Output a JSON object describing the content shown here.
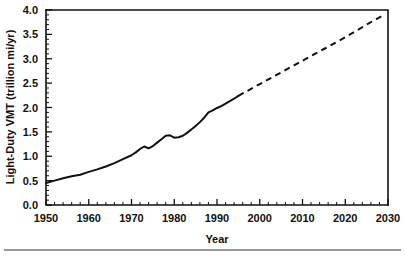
{
  "chart_data": {
    "type": "line",
    "title": "",
    "xlabel": "Year",
    "ylabel": "Light-Duty VMT (trillion mi/yr)",
    "xlim": [
      1950,
      2030
    ],
    "ylim": [
      0.0,
      4.0
    ],
    "grid": false,
    "legend": "none",
    "x_ticks": [
      1950,
      1960,
      1970,
      1980,
      1990,
      2000,
      2010,
      2020,
      2030
    ],
    "x_tick_labels": [
      "1950",
      "1960",
      "1970",
      "1980",
      "1990",
      "2000",
      "2010",
      "2020",
      "2030"
    ],
    "x_minor_tick_interval": 2,
    "y_ticks": [
      0.0,
      0.5,
      1.0,
      1.5,
      2.0,
      2.5,
      3.0,
      3.5,
      4.0
    ],
    "y_tick_labels": [
      "0.0",
      "0.5",
      "1.0",
      "1.5",
      "2.0",
      "2.5",
      "3.0",
      "3.5",
      "4.0"
    ],
    "y_minor_tick_interval": 0.1,
    "axis_color": "#111111",
    "line_color": "#111111",
    "series": [
      {
        "name": "Light-Duty VMT historical",
        "style": "solid",
        "x": [
          1950,
          1952,
          1954,
          1956,
          1958,
          1960,
          1962,
          1964,
          1966,
          1968,
          1970,
          1971,
          1972,
          1973,
          1974,
          1975,
          1976,
          1977,
          1978,
          1979,
          1980,
          1981,
          1982,
          1983,
          1984,
          1985,
          1986,
          1987,
          1988,
          1989,
          1990,
          1991,
          1992,
          1993,
          1994,
          1995
        ],
        "values": [
          0.45,
          0.5,
          0.55,
          0.59,
          0.62,
          0.68,
          0.73,
          0.79,
          0.86,
          0.94,
          1.02,
          1.08,
          1.15,
          1.2,
          1.16,
          1.21,
          1.28,
          1.35,
          1.42,
          1.43,
          1.38,
          1.39,
          1.42,
          1.48,
          1.55,
          1.62,
          1.7,
          1.79,
          1.9,
          1.94,
          1.99,
          2.03,
          2.08,
          2.13,
          2.18,
          2.24
        ]
      },
      {
        "name": "Light-Duty VMT projected",
        "style": "dashed",
        "x": [
          1995,
          2000,
          2005,
          2010,
          2015,
          2020,
          2025,
          2029
        ],
        "values": [
          2.24,
          2.48,
          2.72,
          2.96,
          3.2,
          3.44,
          3.7,
          3.9
        ]
      }
    ]
  }
}
